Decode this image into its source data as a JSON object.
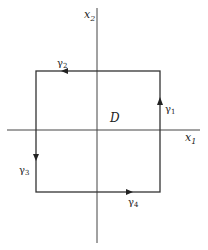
{
  "diagram": {
    "type": "contour-rectangle",
    "axes": {
      "horizontal_label": "x",
      "horizontal_sub": "1",
      "vertical_label": "x",
      "vertical_sub": "2"
    },
    "region_label": "D",
    "curves": [
      {
        "name": "γ",
        "sub": "1",
        "side": "right",
        "direction": "up"
      },
      {
        "name": "γ",
        "sub": "2",
        "side": "top",
        "direction": "left"
      },
      {
        "name": "γ",
        "sub": "3",
        "side": "left",
        "direction": "down"
      },
      {
        "name": "γ",
        "sub": "4",
        "side": "bottom",
        "direction": "right"
      }
    ],
    "colors": {
      "line": "#333333",
      "text": "#222222"
    }
  }
}
